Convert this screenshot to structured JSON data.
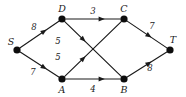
{
  "diagram": {
    "background_color": "#ffffff",
    "stroke_color": "#1a1a1a",
    "node_color": "#0d0d0d",
    "nodes": [
      {
        "id": "S",
        "label": "S",
        "x": 17,
        "y": 50,
        "r": 3.6,
        "label_x": 11,
        "label_y": 42
      },
      {
        "id": "D",
        "label": "D",
        "x": 62,
        "y": 19,
        "r": 3.6,
        "label_x": 62,
        "label_y": 9
      },
      {
        "id": "C",
        "label": "C",
        "x": 124,
        "y": 19,
        "r": 3.6,
        "label_x": 124,
        "label_y": 9
      },
      {
        "id": "A",
        "label": "A",
        "x": 62,
        "y": 79,
        "r": 3.6,
        "label_x": 62,
        "label_y": 90
      },
      {
        "id": "B",
        "label": "B",
        "x": 124,
        "y": 79,
        "r": 3.6,
        "label_x": 124,
        "label_y": 90
      },
      {
        "id": "T",
        "label": "T",
        "x": 170,
        "y": 50,
        "r": 3.6,
        "label_x": 173,
        "label_y": 40
      }
    ],
    "edges": [
      {
        "id": "S-D",
        "from": "S",
        "to": "D",
        "weight": "8",
        "weight_x": 34,
        "weight_y": 27,
        "arrow_t": 0.62
      },
      {
        "id": "S-A",
        "from": "S",
        "to": "A",
        "weight": "7",
        "weight_x": 33,
        "weight_y": 72,
        "arrow_t": 0.62
      },
      {
        "id": "D-C",
        "from": "D",
        "to": "C",
        "weight": "3",
        "weight_x": 93,
        "weight_y": 11,
        "arrow_t": 0.66
      },
      {
        "id": "D-B",
        "from": "D",
        "to": "B",
        "weight": "5",
        "weight_x": 58,
        "weight_y": 41,
        "arrow_t": 0.33
      },
      {
        "id": "A-C",
        "from": "A",
        "to": "C",
        "weight": "5",
        "weight_x": 58,
        "weight_y": 57,
        "arrow_t": 0.33
      },
      {
        "id": "A-B",
        "from": "A",
        "to": "B",
        "weight": "4",
        "weight_x": 93,
        "weight_y": 89,
        "arrow_t": 0.66
      },
      {
        "id": "C-T",
        "from": "C",
        "to": "T",
        "weight": "7",
        "weight_x": 152,
        "weight_y": 26,
        "arrow_t": 0.55
      },
      {
        "id": "B-T",
        "from": "B",
        "to": "T",
        "weight": "8",
        "weight_x": 150,
        "weight_y": 68,
        "arrow_t": 0.55
      }
    ]
  }
}
